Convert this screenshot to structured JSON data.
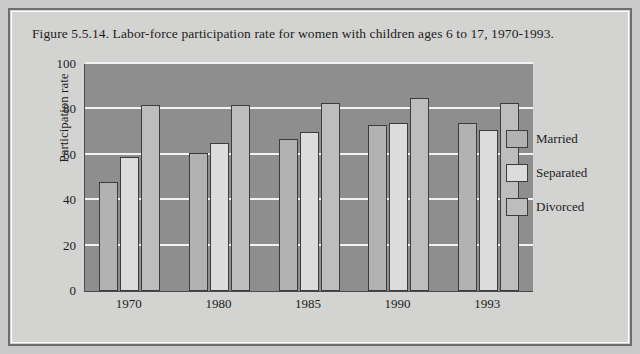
{
  "figure": {
    "title": "Figure 5.5.14. Labor-force participation rate for women with children ages 6 to 17, 1970-1993."
  },
  "colors": {
    "page_background": "#c9c9c9",
    "panel_background": "#d3d3d1",
    "plot_background": "#8e8e8e",
    "gridline": "#f2f2f2",
    "axis": "#4a4a4a",
    "bar_outline": "#3c3c3c",
    "series_married": "#b2b2b2",
    "series_separated": "#dcdcdc",
    "series_divorced": "#bdbdbd",
    "text": "#1d1d1d"
  },
  "chart_data": {
    "type": "bar",
    "title": "Figure 5.5.14. Labor-force participation rate for women with children ages 6 to 17, 1970-1993.",
    "xlabel": "",
    "ylabel": "Participation rate",
    "ylim": [
      0,
      100
    ],
    "yticks": [
      0,
      20,
      40,
      60,
      80,
      100
    ],
    "grid": true,
    "legend_position": "inside-right",
    "categories": [
      "1970",
      "1980",
      "1985",
      "1990",
      "1993"
    ],
    "series": [
      {
        "name": "Married",
        "color": "#b2b2b2",
        "values": [
          48,
          61,
          67,
          73,
          74
        ]
      },
      {
        "name": "Separated",
        "color": "#dcdcdc",
        "values": [
          59,
          65,
          70,
          74,
          71
        ]
      },
      {
        "name": "Divorced",
        "color": "#bdbdbd",
        "values": [
          82,
          82,
          83,
          85,
          83
        ]
      }
    ]
  },
  "legend": {
    "items": [
      {
        "label": "Married"
      },
      {
        "label": "Separated"
      },
      {
        "label": "Divorced"
      }
    ]
  }
}
